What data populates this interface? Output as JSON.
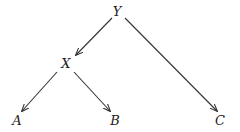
{
  "diagram": {
    "type": "tree",
    "nodes": [
      {
        "id": "Y",
        "label": "Y",
        "x": 117,
        "y": 11
      },
      {
        "id": "X",
        "label": "X",
        "x": 66,
        "y": 62
      },
      {
        "id": "A",
        "label": "A",
        "x": 17,
        "y": 120
      },
      {
        "id": "B",
        "label": "B",
        "x": 115,
        "y": 120
      },
      {
        "id": "C",
        "label": "C",
        "x": 220,
        "y": 120
      }
    ],
    "edges": [
      {
        "from": "Y",
        "to": "X",
        "directed": true
      },
      {
        "from": "X",
        "to": "A",
        "directed": true
      },
      {
        "from": "X",
        "to": "B",
        "directed": true
      },
      {
        "from": "Y",
        "to": "C",
        "directed": true
      }
    ],
    "colors": {
      "line": "#333333",
      "text": "#222222",
      "background": "#ffffff"
    }
  }
}
